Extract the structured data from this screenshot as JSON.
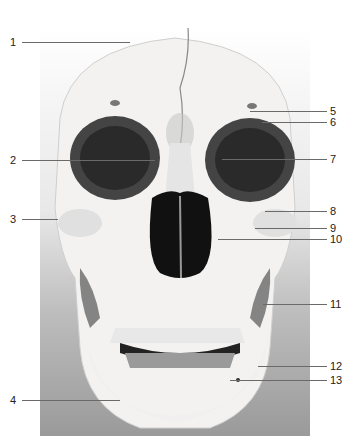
{
  "figure": {
    "labels": [
      {
        "num": "1",
        "x": 10,
        "y": 37,
        "line_x1": 22,
        "line_x2": 130
      },
      {
        "num": "2",
        "x": 10,
        "y": 155,
        "line_x1": 22,
        "line_x2": 155
      },
      {
        "num": "3",
        "x": 10,
        "y": 214,
        "line_x1": 22,
        "line_x2": 58
      },
      {
        "num": "4",
        "x": 10,
        "y": 395,
        "line_x1": 22,
        "line_x2": 120
      },
      {
        "num": "5",
        "x": 330,
        "y": 106,
        "line_x1": 250,
        "line_x2": 327
      },
      {
        "num": "6",
        "x": 330,
        "y": 117,
        "line_x1": 262,
        "line_x2": 327
      },
      {
        "num": "7",
        "x": 330,
        "y": 154,
        "line_x1": 222,
        "line_x2": 327
      },
      {
        "num": "8",
        "x": 330,
        "y": 206,
        "line_x1": 265,
        "line_x2": 327
      },
      {
        "num": "9",
        "x": 330,
        "y": 223,
        "line_x1": 255,
        "line_x2": 327
      },
      {
        "num": "10",
        "x": 330,
        "y": 234,
        "line_x1": 218,
        "line_x2": 327
      },
      {
        "num": "11",
        "x": 330,
        "y": 299,
        "line_x1": 263,
        "line_x2": 327
      },
      {
        "num": "12",
        "x": 330,
        "y": 361,
        "line_x1": 258,
        "line_x2": 327
      },
      {
        "num": "13",
        "x": 330,
        "y": 375,
        "line_x1": 230,
        "line_x2": 327
      }
    ]
  }
}
